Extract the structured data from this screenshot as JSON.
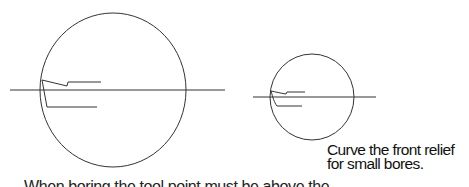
{
  "diagram": {
    "stroke_color": "#333333",
    "large_bore": {
      "circle": {
        "cx": 113,
        "cy": 90,
        "rx": 73,
        "ry": 77
      },
      "centerline": {
        "x1": 10,
        "y1": 90,
        "x2": 225,
        "y2": 90
      },
      "tool_path_upper": "M42,80 L67,86 L68,82 L101,82",
      "tool_path_lower": "M42,80 L47,107 L97,107"
    },
    "small_bore": {
      "circle": {
        "cx": 312,
        "cy": 97,
        "rx": 42,
        "ry": 43
      },
      "centerline": {
        "x1": 253,
        "y1": 97,
        "x2": 376,
        "y2": 97
      },
      "tool_path_upper": "M271,91 C276,92 280,93 286,94 L287,92 L305,92",
      "tool_path_lower": "M271,91 C273,98 274,102 277,106 L302,106"
    }
  },
  "caption": {
    "line1": "Curve the front relief",
    "line2": "for small bores."
  },
  "cutoff_text": "When boring the tool point must be above the"
}
